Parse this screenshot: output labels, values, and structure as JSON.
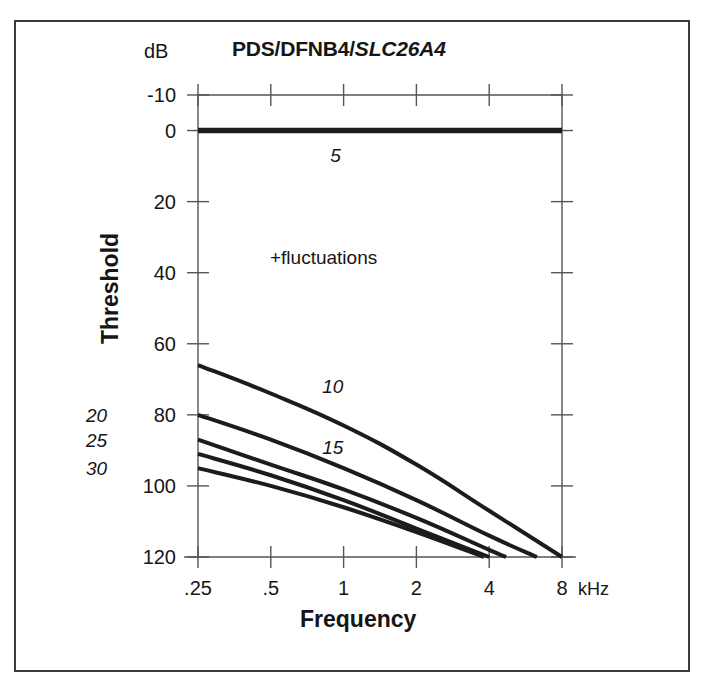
{
  "figure": {
    "title_plain": "PDS/DFNB4/",
    "title_italic": "SLC26A4",
    "db_unit": "dB",
    "khz_unit": "kHz",
    "y_axis_title": "Threshold",
    "x_axis_title": "Frequency",
    "annotation": "+fluctuations",
    "border_color": "#3a3a3a",
    "curve_color": "#1c1c1c",
    "axis_color": "#555555",
    "text_color": "#161616"
  },
  "chart_data": {
    "type": "line",
    "title": "PDS/DFNB4/SLC26A4",
    "subtitle": "",
    "xlabel": "Frequency",
    "ylabel": "Threshold",
    "x_unit": "kHz",
    "y_unit": "dB",
    "x_scale": "log2",
    "x_ticks": [
      0.25,
      0.5,
      1,
      2,
      4,
      8
    ],
    "x_tick_labels": [
      ".25",
      ".5",
      "1",
      "2",
      "4",
      "8"
    ],
    "xlim": [
      0.25,
      8
    ],
    "y_ticks": [
      -10,
      0,
      20,
      40,
      60,
      80,
      100,
      120
    ],
    "y_tick_labels": [
      "-10",
      "0",
      "20",
      "40",
      "60",
      "80",
      "100",
      "120"
    ],
    "ylim": [
      -10,
      120
    ],
    "y_inverted": true,
    "grid": false,
    "legend": "inline-curve-labels",
    "annotations": [
      {
        "text": "+fluctuations",
        "x": 0.62,
        "y": 42,
        "style": "plain"
      },
      {
        "text": "5",
        "x": 0.95,
        "y": 7,
        "style": "italic"
      },
      {
        "text": "10",
        "x": 0.88,
        "y": 72,
        "style": "italic"
      },
      {
        "text": "15",
        "x": 0.88,
        "y": 89,
        "style": "italic"
      },
      {
        "text": "20",
        "x": null,
        "y": 80,
        "style": "italic",
        "position": "left-outside"
      },
      {
        "text": "25",
        "x": null,
        "y": 87,
        "style": "italic",
        "position": "left-outside"
      },
      {
        "text": "30",
        "x": null,
        "y": 95,
        "style": "italic",
        "position": "left-outside"
      }
    ],
    "series": [
      {
        "name": "5",
        "label": "5",
        "points": [
          {
            "x": 0.25,
            "y": 0
          },
          {
            "x": 0.5,
            "y": 0
          },
          {
            "x": 1,
            "y": 0
          },
          {
            "x": 2,
            "y": 0
          },
          {
            "x": 4,
            "y": 0
          },
          {
            "x": 8,
            "y": 0
          }
        ]
      },
      {
        "name": "10",
        "label": "10",
        "points": [
          {
            "x": 0.25,
            "y": 66
          },
          {
            "x": 0.5,
            "y": 74
          },
          {
            "x": 1,
            "y": 83
          },
          {
            "x": 2,
            "y": 94
          },
          {
            "x": 4,
            "y": 107
          },
          {
            "x": 8,
            "y": 120
          }
        ]
      },
      {
        "name": "15",
        "label": "15",
        "points": [
          {
            "x": 0.25,
            "y": 80
          },
          {
            "x": 0.5,
            "y": 87
          },
          {
            "x": 1,
            "y": 95
          },
          {
            "x": 2,
            "y": 104
          },
          {
            "x": 4,
            "y": 114
          },
          {
            "x": 6.3,
            "y": 120
          }
        ]
      },
      {
        "name": "20",
        "label": "20",
        "points": [
          {
            "x": 0.25,
            "y": 87
          },
          {
            "x": 0.5,
            "y": 94
          },
          {
            "x": 1,
            "y": 101
          },
          {
            "x": 2,
            "y": 109
          },
          {
            "x": 4,
            "y": 118
          },
          {
            "x": 4.7,
            "y": 120
          }
        ]
      },
      {
        "name": "25",
        "label": "25",
        "points": [
          {
            "x": 0.25,
            "y": 91
          },
          {
            "x": 0.5,
            "y": 97
          },
          {
            "x": 1,
            "y": 104
          },
          {
            "x": 2,
            "y": 112
          },
          {
            "x": 4,
            "y": 120
          }
        ]
      },
      {
        "name": "30",
        "label": "30",
        "points": [
          {
            "x": 0.25,
            "y": 95
          },
          {
            "x": 0.5,
            "y": 100
          },
          {
            "x": 1,
            "y": 106
          },
          {
            "x": 2,
            "y": 113
          },
          {
            "x": 3.8,
            "y": 120
          }
        ]
      }
    ]
  }
}
